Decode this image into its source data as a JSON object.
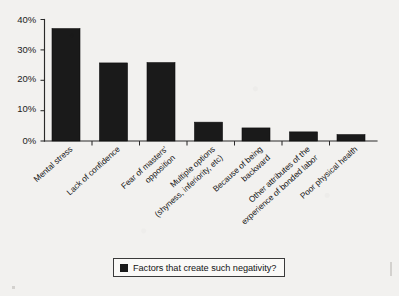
{
  "chart_data": {
    "type": "bar",
    "title": "",
    "subtitle": "",
    "xlabel": "",
    "ylabel": "",
    "categories": [
      "Mental stress",
      "Lack of confidence",
      "Fear of masters' opposition",
      "Multiple options (shyness, inferiority, etc)",
      "Because of being backward",
      "Other attributes of the experience of bonded labor",
      "Poor physical health"
    ],
    "category_lines": [
      [
        "Mental stress"
      ],
      [
        "Lack of confidence"
      ],
      [
        "Fear of masters'",
        "opposition"
      ],
      [
        "Multiple options",
        "(shyness, inferiority, etc)"
      ],
      [
        "Because of being",
        "backward"
      ],
      [
        "Other attributes of the",
        "experience of bonded labor"
      ],
      [
        "Poor physical health"
      ]
    ],
    "values": [
      37,
      25.7,
      25.8,
      6.2,
      4.3,
      3.0,
      2.1
    ],
    "series": [
      {
        "name": "Factors that create such negativity?",
        "values": [
          37,
          25.7,
          25.8,
          6.2,
          4.3,
          3.0,
          2.1
        ]
      }
    ],
    "ylim": [
      0,
      40
    ],
    "yticks": [
      0,
      10,
      20,
      30,
      40
    ],
    "ytick_labels": [
      "0%",
      "10%",
      "20%",
      "30%",
      "40%"
    ],
    "grid": false,
    "legend_position": "bottom",
    "bar_color": "#1a1a1a",
    "background_color": "#f2f1ef",
    "axis_color": "#2a2a2a"
  },
  "legend": {
    "items": [
      {
        "label": "Factors that create such negativity?",
        "color": "#1a1a1a"
      }
    ]
  }
}
